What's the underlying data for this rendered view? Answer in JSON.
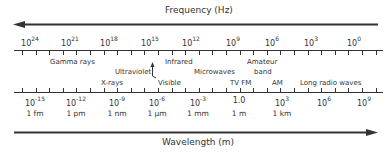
{
  "frequency_axis": {
    "title": "Frequency (Hz)",
    "arrow_direction": "left",
    "tick_labels": [
      {
        "base": "10",
        "exp": "24",
        "x": 30
      },
      {
        "base": "10",
        "exp": "21",
        "x": 70
      },
      {
        "base": "10",
        "exp": "18",
        "x": 109
      },
      {
        "base": "10",
        "exp": "15",
        "x": 150
      },
      {
        "base": "10",
        "exp": "12",
        "x": 191
      },
      {
        "base": "10",
        "exp": "9",
        "x": 233
      },
      {
        "base": "10",
        "exp": "6",
        "x": 272
      },
      {
        "base": "10",
        "exp": "3",
        "x": 311
      },
      {
        "base": "10",
        "exp": "0",
        "x": 354
      }
    ]
  },
  "bands": [
    {
      "label": "Gamma rays",
      "x": 50,
      "y": 58
    },
    {
      "label": "X-rays",
      "x": 101,
      "y": 79
    },
    {
      "label": "Ultraviolet",
      "x": 115,
      "y": 68
    },
    {
      "label": "Visible",
      "x": 158,
      "y": 79
    },
    {
      "label": "Infrared",
      "x": 165,
      "y": 58
    },
    {
      "label": "Microwaves",
      "x": 194,
      "y": 68
    },
    {
      "label": "TV FM",
      "x": 230,
      "y": 79
    },
    {
      "label": "Amateur",
      "x": 247,
      "y": 58
    },
    {
      "label": "band",
      "x": 254,
      "y": 68
    },
    {
      "label": "AM",
      "x": 272,
      "y": 79
    },
    {
      "label": "Long radio waves",
      "x": 300,
      "y": 79
    }
  ],
  "wavelength_axis": {
    "title": "Wavelength (m)",
    "arrow_direction": "right",
    "tick_labels": [
      {
        "base": "10",
        "exp": "-15",
        "unit": "1 fm",
        "x": 35
      },
      {
        "base": "10",
        "exp": "-12",
        "unit": "1 pm",
        "x": 76
      },
      {
        "base": "10",
        "exp": "-9",
        "unit": "1 nm",
        "x": 117
      },
      {
        "base": "10",
        "exp": "-6",
        "unit": "1 μm",
        "x": 157
      },
      {
        "base": "10",
        "exp": "-3",
        "unit": "1 mm",
        "x": 198
      },
      {
        "base": "1.0",
        "exp": "",
        "unit": "1 m",
        "x": 239
      },
      {
        "base": "10",
        "exp": "3",
        "unit": "1 km",
        "x": 282
      },
      {
        "base": "10",
        "exp": "6",
        "unit": "",
        "x": 324
      },
      {
        "base": "10",
        "exp": "9",
        "unit": "",
        "x": 364
      }
    ]
  }
}
